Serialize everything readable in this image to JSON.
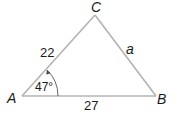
{
  "diagram": {
    "type": "triangle",
    "colors": {
      "edge": "#b3b3b3",
      "text": "#1a1a1a",
      "background": "#ffffff"
    },
    "vertices": [
      {
        "id": "A",
        "label": "A",
        "x": 22,
        "y": 96
      },
      {
        "id": "B",
        "label": "B",
        "x": 156,
        "y": 96
      },
      {
        "id": "C",
        "label": "C",
        "x": 95,
        "y": 15
      }
    ],
    "sides": [
      {
        "between": "A-C",
        "label": "22"
      },
      {
        "between": "A-B",
        "label": "27"
      },
      {
        "between": "B-C",
        "label": "a"
      }
    ],
    "angles": [
      {
        "at": "A",
        "label": "47°",
        "arrow": true
      }
    ]
  }
}
